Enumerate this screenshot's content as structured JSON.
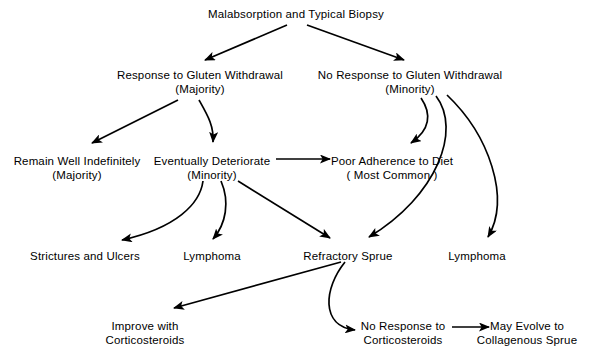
{
  "diagram": {
    "background_color": "#ffffff",
    "stroke_color": "#000000",
    "nodes": [
      {
        "id": "root",
        "line1": "Malabsorption and Typical Biopsy",
        "line2": "",
        "x": 296,
        "y": 8
      },
      {
        "id": "response",
        "line1": "Response to Gluten Withdrawal",
        "line2": "(Majority)",
        "x": 200,
        "y": 69
      },
      {
        "id": "no-response",
        "line1": "No Response to Gluten Withdrawal",
        "line2": "(Minority)",
        "x": 410,
        "y": 69
      },
      {
        "id": "remain-well",
        "line1": "Remain Well Indefinitely",
        "line2": "(Majority)",
        "x": 77,
        "y": 155
      },
      {
        "id": "deteriorate",
        "line1": "Eventually Deteriorate",
        "line2": "(Minority)",
        "x": 212,
        "y": 155
      },
      {
        "id": "poor-adherence",
        "line1": "Poor Adherence to Diet",
        "line2": "( Most Common )",
        "x": 392,
        "y": 155
      },
      {
        "id": "strictures",
        "line1": "Strictures and Ulcers",
        "line2": "",
        "x": 85,
        "y": 250
      },
      {
        "id": "lymphoma-left",
        "line1": "Lymphoma",
        "line2": "",
        "x": 212,
        "y": 250
      },
      {
        "id": "refractory",
        "line1": "Refractory Sprue",
        "line2": "",
        "x": 348,
        "y": 250
      },
      {
        "id": "lymphoma-right",
        "line1": "Lymphoma",
        "line2": "",
        "x": 477,
        "y": 250
      },
      {
        "id": "improve",
        "line1": "Improve with",
        "line2": "Corticosteroids",
        "x": 145,
        "y": 320
      },
      {
        "id": "no-response-cortico",
        "line1": "No Response to",
        "line2": "Corticosteroids",
        "x": 403,
        "y": 320
      },
      {
        "id": "collagenous",
        "line1": "May Evolve to",
        "line2": "Collagenous Sprue",
        "x": 527,
        "y": 320
      }
    ],
    "edges": [
      {
        "id": "root-to-response",
        "from": "root",
        "to": "response",
        "style": "straight"
      },
      {
        "id": "root-to-no-response",
        "from": "root",
        "to": "no-response",
        "style": "straight"
      },
      {
        "id": "response-to-remain-well",
        "from": "response",
        "to": "remain-well",
        "style": "straight"
      },
      {
        "id": "response-to-deteriorate",
        "from": "response",
        "to": "deteriorate",
        "style": "curved"
      },
      {
        "id": "no-response-to-poor-adherence",
        "from": "no-response",
        "to": "poor-adherence",
        "style": "curved"
      },
      {
        "id": "no-response-to-refractory",
        "from": "no-response",
        "to": "refractory",
        "style": "curved"
      },
      {
        "id": "no-response-to-lymphoma-right",
        "from": "no-response",
        "to": "lymphoma-right",
        "style": "curved"
      },
      {
        "id": "deteriorate-to-poor-adherence",
        "from": "deteriorate",
        "to": "poor-adherence",
        "style": "straight"
      },
      {
        "id": "deteriorate-to-strictures",
        "from": "deteriorate",
        "to": "strictures",
        "style": "curved"
      },
      {
        "id": "deteriorate-to-lymphoma-left",
        "from": "deteriorate",
        "to": "lymphoma-left",
        "style": "curved"
      },
      {
        "id": "deteriorate-to-refractory",
        "from": "deteriorate",
        "to": "refractory",
        "style": "straight"
      },
      {
        "id": "refractory-to-improve",
        "from": "refractory",
        "to": "improve",
        "style": "straight"
      },
      {
        "id": "refractory-to-no-response-cortico",
        "from": "refractory",
        "to": "no-response-cortico",
        "style": "curved"
      },
      {
        "id": "no-response-cortico-to-collagenous",
        "from": "no-response-cortico",
        "to": "collagenous",
        "style": "straight"
      }
    ]
  }
}
